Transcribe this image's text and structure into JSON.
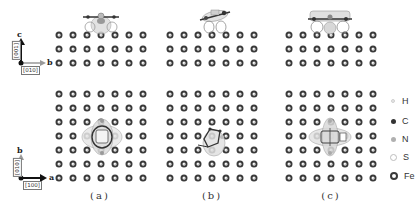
{
  "figure": {
    "panels": [
      {
        "id": "a",
        "label": "(a)",
        "label_x": 100,
        "x0": 59,
        "adsorbate": "flat-ring-molecule"
      },
      {
        "id": "b",
        "label": "(b)",
        "label_x": 212,
        "x0": 170,
        "adsorbate": "tilted-ring-molecule"
      },
      {
        "id": "c",
        "label": "(c)",
        "label_x": 331,
        "x0": 289,
        "adsorbate": "extended-flat-molecule"
      }
    ],
    "lattice": {
      "columns": 7,
      "spacing": 14,
      "side_view_rows_y": [
        35,
        49,
        63
      ],
      "top_view_rows_y": [
        94,
        108,
        122,
        136,
        150,
        164,
        178
      ]
    },
    "side_view_axes": {
      "vertical_label": "c",
      "vertical_direction": "[001]",
      "horizontal_label": "b",
      "horizontal_direction": "[010]"
    },
    "top_view_axes": {
      "vertical_label": "b",
      "vertical_direction": "[010]",
      "horizontal_label": "a",
      "horizontal_direction": "[100]"
    },
    "legend": [
      {
        "symbol": "H",
        "color": "#e6e6e6",
        "border": "#d0d0d0",
        "size": 4,
        "y": 101
      },
      {
        "symbol": "C",
        "color": "#333333",
        "border": "#333333",
        "size": 5,
        "y": 121
      },
      {
        "symbol": "N",
        "color": "#b0b0b0",
        "border": "#a0a0a0",
        "size": 5,
        "y": 139
      },
      {
        "symbol": "S",
        "color": "#ffffff",
        "border": "#bdbdbd",
        "size": 7,
        "y": 157
      },
      {
        "symbol": "Fe",
        "color": "#ffffff",
        "border": "#3a3a3a",
        "size": 8,
        "y": 176
      }
    ]
  }
}
